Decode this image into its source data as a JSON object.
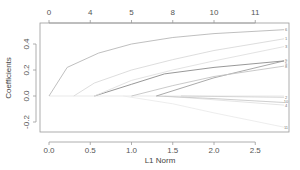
{
  "chart_data": {
    "type": "line",
    "title": "",
    "xlabel": "L1 Norm",
    "ylabel": "Coefficients",
    "xlim": [
      -0.1,
      2.9
    ],
    "ylim": [
      -0.28,
      0.56
    ],
    "grid": false,
    "legend": "none",
    "x_ticks": [
      "0.0",
      "0.5",
      "1.0",
      "1.5",
      "2.0",
      "2.5"
    ],
    "y_ticks": [
      "-0.2",
      "0.0",
      "0.2",
      "0.4"
    ],
    "top_axis": {
      "description": "number of nonzero coefficients",
      "ticks": [
        "0",
        "4",
        "5",
        "8",
        "10",
        "11"
      ],
      "positions": [
        0.0,
        0.5,
        1.0,
        1.5,
        2.0,
        2.5
      ]
    },
    "series": [
      {
        "name": "6",
        "color": "#b8b8b8",
        "points": [
          [
            0.0,
            0.0
          ],
          [
            0.22,
            0.22
          ],
          [
            0.6,
            0.33
          ],
          [
            1.0,
            0.4
          ],
          [
            1.5,
            0.45
          ],
          [
            2.0,
            0.48
          ],
          [
            2.85,
            0.51
          ]
        ]
      },
      {
        "name": "1",
        "color": "#d9d9d9",
        "points": [
          [
            0.3,
            0.0
          ],
          [
            0.55,
            0.1
          ],
          [
            1.0,
            0.2
          ],
          [
            1.5,
            0.28
          ],
          [
            2.0,
            0.35
          ],
          [
            2.85,
            0.44
          ]
        ]
      },
      {
        "name": "3",
        "color": "#e0e0e0",
        "points": [
          [
            0.55,
            0.0
          ],
          [
            1.0,
            0.12
          ],
          [
            1.5,
            0.2
          ],
          [
            2.0,
            0.27
          ],
          [
            2.85,
            0.38
          ]
        ]
      },
      {
        "name": "9",
        "color": "#8c8c8c",
        "points": [
          [
            0.55,
            0.0
          ],
          [
            1.0,
            0.09
          ],
          [
            1.4,
            0.17
          ],
          [
            2.0,
            0.22
          ],
          [
            2.85,
            0.27
          ]
        ]
      },
      {
        "name": "8",
        "color": "#c4c4c4",
        "points": [
          [
            1.0,
            0.0
          ],
          [
            1.5,
            0.08
          ],
          [
            2.0,
            0.15
          ],
          [
            2.85,
            0.23
          ]
        ]
      },
      {
        "name": "5",
        "color": "#a0a0a0",
        "points": [
          [
            1.3,
            0.0
          ],
          [
            2.0,
            0.14
          ],
          [
            2.85,
            0.27
          ]
        ]
      },
      {
        "name": "2",
        "color": "#d0d0d0",
        "points": [
          [
            1.6,
            0.0
          ],
          [
            2.85,
            -0.01
          ]
        ]
      },
      {
        "name": "10",
        "color": "#c8c8c8",
        "points": [
          [
            1.3,
            0.0
          ],
          [
            2.0,
            -0.02
          ],
          [
            2.85,
            -0.05
          ]
        ]
      },
      {
        "name": "4",
        "color": "#e2e2e2",
        "points": [
          [
            1.4,
            0.0
          ],
          [
            2.85,
            -0.07
          ]
        ]
      },
      {
        "name": "11",
        "color": "#ebebeb",
        "points": [
          [
            0.9,
            0.0
          ],
          [
            1.5,
            -0.06
          ],
          [
            2.0,
            -0.13
          ],
          [
            2.85,
            -0.24
          ]
        ]
      },
      {
        "name": "7",
        "color": "#e6e6e6",
        "points": [
          [
            0.0,
            0.0
          ],
          [
            2.85,
            0.0
          ]
        ]
      }
    ],
    "right_labels": [
      {
        "text": "6",
        "y": 0.51
      },
      {
        "text": "1",
        "y": 0.44
      },
      {
        "text": "3",
        "y": 0.38
      },
      {
        "text": "9",
        "y": 0.27
      },
      {
        "text": "5",
        "y": 0.25
      },
      {
        "text": "8",
        "y": 0.23
      },
      {
        "text": "2",
        "y": -0.01
      },
      {
        "text": "10",
        "y": -0.045
      },
      {
        "text": "4",
        "y": -0.07
      },
      {
        "text": "11",
        "y": -0.24
      }
    ]
  },
  "layout": {
    "plot": {
      "left": 40,
      "right": 289,
      "top": 23,
      "bottom": 132
    },
    "x0px": 49,
    "xscale": 82.5,
    "y0px": 96,
    "yscale": 130
  }
}
